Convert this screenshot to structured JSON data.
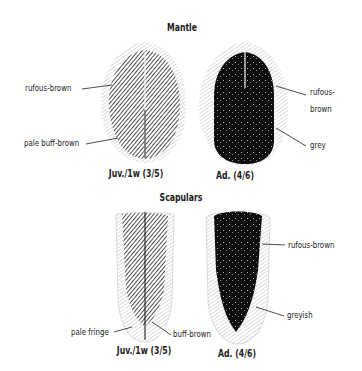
{
  "figure": {
    "sections": [
      {
        "title": "Mantle",
        "feathers": [
          {
            "caption": "Juv./1w (3/5)",
            "labels": [
              "rufous-brown",
              "pale buff-brown"
            ]
          },
          {
            "caption": "Ad. (4/6)",
            "labels": [
              "rufous-",
              "brown",
              "grey"
            ]
          }
        ]
      },
      {
        "title": "Scapulars",
        "feathers": [
          {
            "caption": "Juv./1w (3/5)",
            "labels": [
              "pale fringe",
              "buff-brown"
            ]
          },
          {
            "caption": "Ad. (4/6)",
            "labels": [
              "rufous-brown",
              "greyish"
            ]
          }
        ]
      }
    ],
    "colors": {
      "ink": "#111111",
      "outline": "#9a9a9a",
      "background": "#ffffff"
    }
  }
}
